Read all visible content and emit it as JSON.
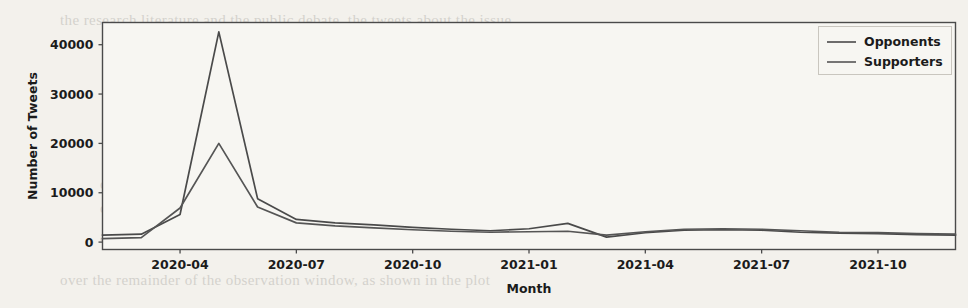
{
  "background": {
    "page_color": "#f3f1ec",
    "bleed_lines": [
      {
        "x": 60,
        "y": 12,
        "text": "the  research  literature  and  the  public  debate,  the  tweets  about  the  issue"
      },
      {
        "x": 150,
        "y": 36,
        "text": "the  way  in  which  there  are  two  sides  in  this  interaction   were  somehow"
      },
      {
        "x": 150,
        "y": 60,
        "text": "mention  of  opponents  and  supporters,  and  especially  an  account  of  how"
      },
      {
        "x": 150,
        "y": 86,
        "text": "discussion  evolved  over  time  during  the  first  two  years  of  the  pandemic"
      },
      {
        "x": 185,
        "y": 112,
        "text": "as  a  whole  in  the  figure  below."
      },
      {
        "x": 120,
        "y": 150,
        "text": "Figure  2:  Monthly  volume  of  tweets  by  group.  A  clear  peak  is  observed"
      },
      {
        "x": 100,
        "y": 176,
        "text": "during  the  data  from  which  we  extracted  the  sample  described  earlier"
      },
      {
        "x": 100,
        "y": 200,
        "text": "discussion,  and  both  groups  reached  a  maximum  in  the  period  of  lockdown"
      },
      {
        "x": 100,
        "y": 228,
        "text": "and  the  subsequent  months,  after  which  activity  declined  steadily"
      },
      {
        "x": 60,
        "y": 272,
        "text": "over  the  remainder  of  the  observation  window,  as  shown  in  the  plot"
      }
    ]
  },
  "chart_data": {
    "type": "line",
    "title": "",
    "xlabel": "Month",
    "ylabel": "Number of Tweets",
    "xtick_labels": [
      "2020-04",
      "2020-07",
      "2020-10",
      "2021-01",
      "2021-04",
      "2021-07",
      "2021-10"
    ],
    "ytick_labels": [
      "0",
      "10000",
      "20000",
      "30000",
      "40000"
    ],
    "ytick_values": [
      0,
      10000,
      20000,
      30000,
      40000
    ],
    "ylim": [
      -1500,
      44500
    ],
    "grid": false,
    "legend_position": "upper right",
    "x": [
      "2020-02",
      "2020-03",
      "2020-04",
      "2020-05",
      "2020-06",
      "2020-07",
      "2020-08",
      "2020-09",
      "2020-10",
      "2020-11",
      "2020-12",
      "2021-01",
      "2021-02",
      "2021-03",
      "2021-04",
      "2021-05",
      "2021-06",
      "2021-07",
      "2021-08",
      "2021-09",
      "2021-10",
      "2021-11",
      "2021-12"
    ],
    "series": [
      {
        "name": "Opponents",
        "color": "#4a4a4a",
        "values": [
          1400,
          1600,
          5600,
          42600,
          8800,
          4600,
          3900,
          3500,
          3000,
          2600,
          2300,
          2700,
          3800,
          1000,
          1900,
          2400,
          2500,
          2400,
          2000,
          1800,
          1700,
          1500,
          1400
        ]
      },
      {
        "name": "Supporters",
        "color": "#555555",
        "values": [
          700,
          900,
          6900,
          20000,
          7100,
          3900,
          3300,
          2900,
          2500,
          2200,
          2000,
          2100,
          2200,
          1400,
          2100,
          2600,
          2700,
          2600,
          2300,
          2000,
          1900,
          1700,
          1600
        ]
      }
    ]
  },
  "axes": {
    "frame_color": "#4a4a4a",
    "plot_bg": "#f7f6f2"
  }
}
